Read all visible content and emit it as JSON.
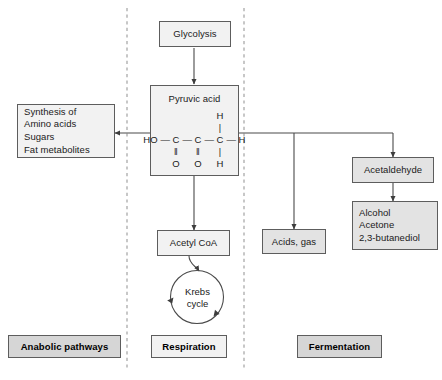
{
  "diagram": {
    "background_color": "#ffffff",
    "box_fill": "#e3e3e3",
    "box_fill_light": "#f2f2f2",
    "label_fill": "#d6d6d6",
    "line_color": "#4a4a4a",
    "divider_color": "#9a9a9a"
  },
  "nodes": {
    "glycolysis": "Glycolysis",
    "pyruvic_acid_title": "Pyruvic acid",
    "anabolic_products": "Synthesis of\nAmino acids\nSugars\nFat metabolites",
    "acetyl_coa": "Acetyl CoA",
    "krebs_cycle": "Krebs\ncycle",
    "acids_gas": "Acids, gas",
    "acetaldehyde": "Acetaldehyde",
    "fermentation_products": "Alcohol\nAcetone\n2,3-butanediol"
  },
  "structure": {
    "caption": "Pyruvic acid structural formula",
    "row_top": [
      "",
      "",
      "",
      "",
      "",
      "H",
      ""
    ],
    "row_top_bond": [
      "",
      "",
      "",
      "",
      "",
      "|",
      ""
    ],
    "row_main": [
      "HO",
      "—",
      "C",
      "—",
      "C",
      "—",
      "C",
      "—",
      "H"
    ],
    "row_bond": [
      "",
      "",
      "‖",
      "",
      "‖",
      "",
      "|",
      "",
      ""
    ],
    "row_bottom": [
      "",
      "",
      "O",
      "",
      "O",
      "",
      "H",
      "",
      ""
    ],
    "atoms": {
      "hydroxyl": "HO",
      "carbon": "C",
      "oxygen": "O",
      "hydrogen": "H",
      "single_bond_h": "—",
      "double_bond_v": "‖",
      "single_bond_v": "|"
    }
  },
  "section_labels": [
    {
      "id": "anabolic",
      "label": "Anabolic pathways"
    },
    {
      "id": "respiration",
      "label": "Respiration"
    },
    {
      "id": "fermentation",
      "label": "Fermentation"
    }
  ],
  "krebs": {
    "line1": "Krebs",
    "line2": "cycle",
    "direction": "clockwise"
  },
  "flows": [
    {
      "from": "glycolysis",
      "to": "pyruvic_acid",
      "style": "arrow-down"
    },
    {
      "from": "pyruvic_acid",
      "to": "anabolic_products",
      "style": "arrow-left"
    },
    {
      "from": "pyruvic_acid",
      "to": "acids_gas",
      "style": "branch-right-down"
    },
    {
      "from": "pyruvic_acid",
      "to": "acetaldehyde",
      "style": "branch-right-down"
    },
    {
      "from": "pyruvic_acid",
      "to": "acetyl_coa",
      "style": "arrow-down"
    },
    {
      "from": "acetyl_coa",
      "to": "krebs_cycle",
      "style": "curved-arrow-down"
    },
    {
      "from": "acetaldehyde",
      "to": "fermentation_products",
      "style": "arrow-down"
    }
  ]
}
